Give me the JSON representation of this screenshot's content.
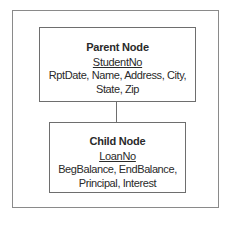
{
  "diagram": {
    "parent": {
      "title": "Parent Node",
      "key": "StudentNo",
      "attributes_line1": "RptDate, Name, Address, City,",
      "attributes_line2": "State, Zip"
    },
    "child": {
      "title": "Child Node",
      "key": "LoanNo",
      "attributes_line1": "BegBalance, EndBalance,",
      "attributes_line2": "Principal, Interest"
    },
    "colors": {
      "border": "#6e6e6e",
      "frame": "#8a8a8a",
      "text": "#2a2a2a"
    }
  }
}
